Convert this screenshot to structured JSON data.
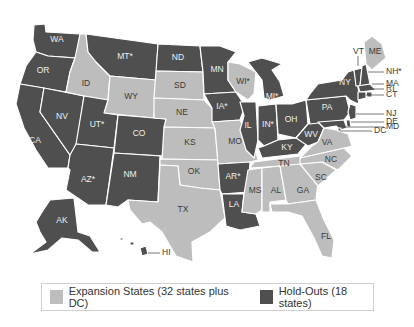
{
  "colors": {
    "expansion": "#bdbdbd",
    "holdout": "#4f4f4f",
    "border": "#ffffff"
  },
  "legend": {
    "expansion_label": "Expansion States (32 states plus DC)",
    "holdout_label": "Hold-Outs (18 states)"
  },
  "states": {
    "WA": {
      "label": "WA",
      "status": "holdout"
    },
    "OR": {
      "label": "OR",
      "status": "holdout"
    },
    "CA": {
      "label": "CA",
      "status": "holdout"
    },
    "NV": {
      "label": "NV",
      "status": "holdout"
    },
    "ID": {
      "label": "ID",
      "status": "expansion"
    },
    "MT": {
      "label": "MT*",
      "status": "holdout"
    },
    "WY": {
      "label": "WY",
      "status": "expansion"
    },
    "UT": {
      "label": "UT*",
      "status": "holdout"
    },
    "AZ": {
      "label": "AZ*",
      "status": "holdout"
    },
    "CO": {
      "label": "CO",
      "status": "holdout"
    },
    "NM": {
      "label": "NM",
      "status": "holdout"
    },
    "ND": {
      "label": "ND",
      "status": "holdout"
    },
    "SD": {
      "label": "SD",
      "status": "expansion"
    },
    "NE": {
      "label": "NE",
      "status": "expansion"
    },
    "KS": {
      "label": "KS",
      "status": "expansion"
    },
    "OK": {
      "label": "OK",
      "status": "expansion"
    },
    "TX": {
      "label": "TX",
      "status": "expansion"
    },
    "MN": {
      "label": "MN",
      "status": "holdout"
    },
    "IA": {
      "label": "IA*",
      "status": "holdout"
    },
    "MO": {
      "label": "MO",
      "status": "expansion"
    },
    "AR": {
      "label": "AR*",
      "status": "holdout"
    },
    "LA": {
      "label": "LA",
      "status": "holdout"
    },
    "WI": {
      "label": "WI*",
      "status": "expansion"
    },
    "IL": {
      "label": "IL",
      "status": "holdout"
    },
    "MI": {
      "label": "MI*",
      "status": "holdout"
    },
    "IN": {
      "label": "IN*",
      "status": "holdout"
    },
    "OH": {
      "label": "OH",
      "status": "holdout"
    },
    "KY": {
      "label": "KY",
      "status": "holdout"
    },
    "TN": {
      "label": "TN",
      "status": "expansion"
    },
    "MS": {
      "label": "MS",
      "status": "expansion"
    },
    "AL": {
      "label": "AL",
      "status": "expansion"
    },
    "GA": {
      "label": "GA",
      "status": "expansion"
    },
    "FL": {
      "label": "FL",
      "status": "expansion"
    },
    "SC": {
      "label": "SC",
      "status": "expansion"
    },
    "NC": {
      "label": "NC",
      "status": "expansion"
    },
    "VA": {
      "label": "VA",
      "status": "expansion"
    },
    "WV": {
      "label": "WV",
      "status": "holdout"
    },
    "PA": {
      "label": "PA",
      "status": "holdout"
    },
    "NY": {
      "label": "NY",
      "status": "holdout"
    },
    "VT": {
      "label": "VT",
      "status": "holdout"
    },
    "NH": {
      "label": "NH*",
      "status": "holdout"
    },
    "ME": {
      "label": "ME",
      "status": "expansion"
    },
    "MA": {
      "label": "MA",
      "status": "holdout"
    },
    "RI": {
      "label": "RI",
      "status": "holdout"
    },
    "CT": {
      "label": "CT",
      "status": "holdout"
    },
    "NJ": {
      "label": "NJ",
      "status": "holdout"
    },
    "DE": {
      "label": "DE",
      "status": "holdout"
    },
    "MD": {
      "label": "MD",
      "status": "holdout"
    },
    "DC": {
      "label": "DC",
      "status": "holdout"
    },
    "AK": {
      "label": "AK",
      "status": "holdout"
    },
    "HI": {
      "label": "HI",
      "status": "holdout"
    }
  }
}
